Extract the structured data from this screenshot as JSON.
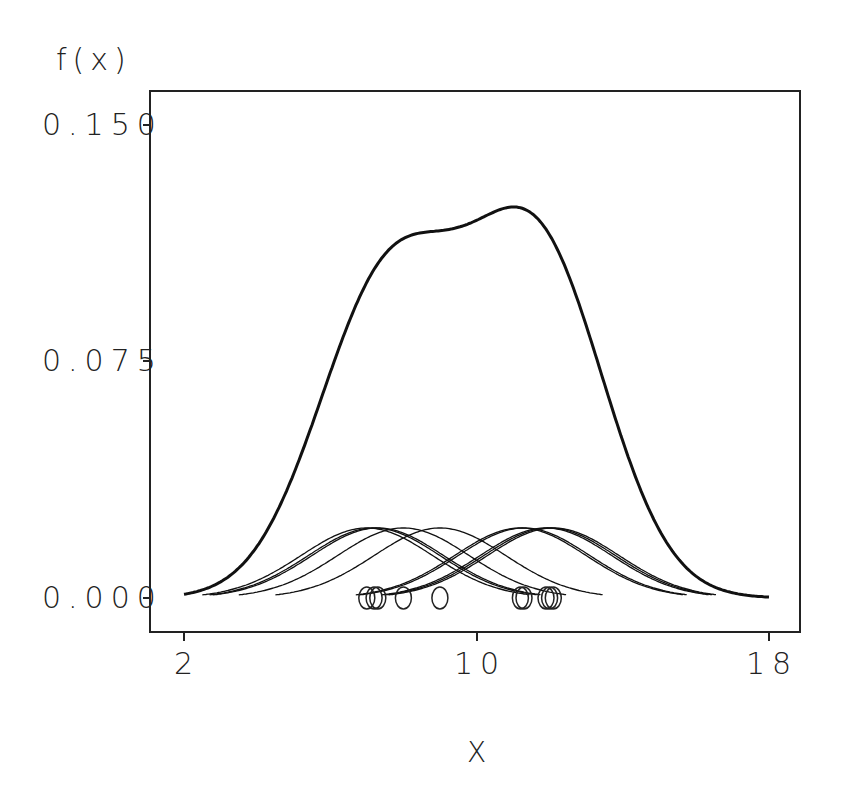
{
  "chart_data": {
    "type": "line",
    "title": "",
    "xlabel": "X",
    "ylabel": "f(x)",
    "xlim": [
      2,
      18
    ],
    "ylim": [
      0.0,
      0.15
    ],
    "x_ticks": [
      "2",
      "10",
      "18"
    ],
    "y_ticks": [
      "0.000",
      "0.075",
      "0.150"
    ],
    "grid": false,
    "legend": null,
    "kernel_bandwidth": 1.8,
    "kernel_peak_height": 0.0222,
    "data_points_x": [
      7.0,
      7.2,
      7.3,
      8.0,
      9.0,
      11.2,
      11.3,
      11.9,
      12.0,
      12.1
    ],
    "series": [
      {
        "name": "kernel density estimate (sum)",
        "style": "thick",
        "x": [
          2,
          3,
          4,
          5,
          6,
          7,
          8,
          9,
          10,
          11,
          11.5,
          12,
          13,
          14,
          15,
          16,
          17,
          18
        ],
        "y": [
          0.001,
          0.006,
          0.019,
          0.045,
          0.079,
          0.105,
          0.114,
          0.115,
          0.119,
          0.124,
          0.124,
          0.12,
          0.09,
          0.048,
          0.017,
          0.004,
          0.001,
          0.001
        ]
      },
      {
        "name": "individual kernels",
        "style": "thin",
        "description": "one Gaussian bump per data point, each peaking at ~0.022"
      }
    ]
  },
  "axes": {
    "ylabel": "f(x)",
    "xlabel": "X",
    "yticks": [
      "0.150",
      "0.075",
      "0.000"
    ],
    "xticks": [
      "2",
      "10",
      "18"
    ]
  }
}
